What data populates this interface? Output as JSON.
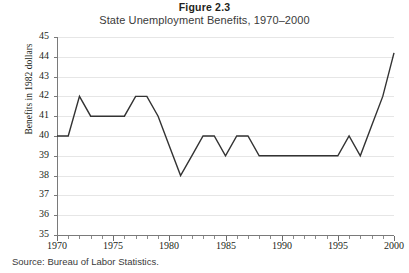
{
  "figure": {
    "number": "Figure 2.3",
    "title": "State Unemployment Benefits, 1970–2000",
    "source": "Source: Bureau of Labor Statistics."
  },
  "chart_data": {
    "type": "line",
    "title": "State Unemployment Benefits, 1970–2000",
    "xlabel": "",
    "ylabel": "Benefits in 1982 dollars",
    "xlim": [
      1970,
      2000
    ],
    "ylim": [
      35,
      45
    ],
    "ytick_labels": [
      "35",
      "36",
      "37",
      "38",
      "39",
      "40",
      "41",
      "42",
      "43",
      "44",
      "45"
    ],
    "yticks": [
      35,
      36,
      37,
      38,
      39,
      40,
      41,
      42,
      43,
      44,
      45
    ],
    "xtick_labels": [
      "1970",
      "1975",
      "1980",
      "1985",
      "1990",
      "1995",
      "2000"
    ],
    "xticks": [
      1970,
      1975,
      1980,
      1985,
      1990,
      1995,
      2000
    ],
    "grid": "horizontal",
    "legend": "none",
    "line_color": "#333333",
    "x": [
      1970,
      1971,
      1972,
      1973,
      1974,
      1975,
      1976,
      1977,
      1978,
      1979,
      1980,
      1981,
      1982,
      1983,
      1984,
      1985,
      1986,
      1987,
      1988,
      1989,
      1990,
      1991,
      1992,
      1993,
      1994,
      1995,
      1996,
      1997,
      1998,
      1999,
      2000
    ],
    "values": [
      40,
      40,
      42,
      41,
      41,
      41,
      41,
      42,
      42,
      41,
      39.5,
      38,
      39,
      40,
      40,
      39,
      40,
      40,
      39,
      39,
      39,
      39,
      39,
      39,
      39,
      39,
      40,
      39,
      40.5,
      42,
      44.2
    ],
    "series": [
      {
        "name": "Benefits in 1982 dollars",
        "values": [
          40,
          40,
          42,
          41,
          41,
          41,
          41,
          42,
          42,
          41,
          39.5,
          38,
          39,
          40,
          40,
          39,
          40,
          40,
          39,
          39,
          39,
          39,
          39,
          39,
          39,
          39,
          40,
          39,
          40.5,
          42,
          44.2
        ]
      }
    ]
  }
}
